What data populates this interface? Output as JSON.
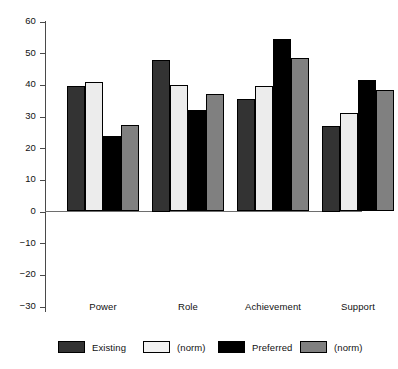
{
  "chart_data": {
    "type": "bar",
    "title": "",
    "subtitle": "",
    "xlabel": "",
    "ylabel": "",
    "categories": [
      "Power",
      "Role",
      "Achievement",
      "Support"
    ],
    "series": [
      {
        "name": "Existing",
        "color": "#333333",
        "values": [
          39.7,
          48.0,
          35.5,
          27.0
        ]
      },
      {
        "name": "(norm)",
        "color": "#ececec",
        "values": [
          41.0,
          40.0,
          39.5,
          31.0
        ]
      },
      {
        "name": "Preferred",
        "color": "#000000",
        "values": [
          23.7,
          32.0,
          54.5,
          41.5
        ]
      },
      {
        "name": "(norm)",
        "color": "#808080",
        "values": [
          27.2,
          37.0,
          48.5,
          38.5
        ]
      }
    ],
    "ylim": [
      -30,
      60
    ],
    "yticks": [
      60,
      50,
      40,
      30,
      20,
      10,
      0,
      "−10",
      "−20",
      "−30"
    ],
    "ytick_values": [
      60,
      50,
      40,
      30,
      20,
      10,
      0,
      -10,
      -20,
      -30
    ],
    "grid": false,
    "legend_position": "bottom",
    "legend": [
      {
        "label": "Existing",
        "color": "#333333"
      },
      {
        "label": "(norm)",
        "color": "#ececec"
      },
      {
        "label": "Preferred",
        "color": "#000000"
      },
      {
        "label": "(norm)",
        "color": "#808080"
      }
    ],
    "axis_color": "#4a4a4a",
    "bar_edge_color": "#000000"
  }
}
